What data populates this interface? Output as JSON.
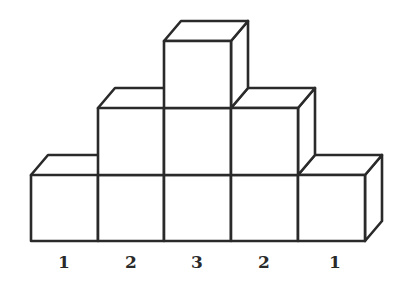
{
  "diagram": {
    "columns": [
      {
        "index": 0,
        "height": 1,
        "label": "1"
      },
      {
        "index": 1,
        "height": 2,
        "label": "2"
      },
      {
        "index": 2,
        "height": 3,
        "label": "3"
      },
      {
        "index": 3,
        "height": 2,
        "label": "2"
      },
      {
        "index": 4,
        "height": 1,
        "label": "1"
      }
    ],
    "colors": {
      "stroke": "#2a2a2a",
      "background": "#ffffff"
    }
  }
}
